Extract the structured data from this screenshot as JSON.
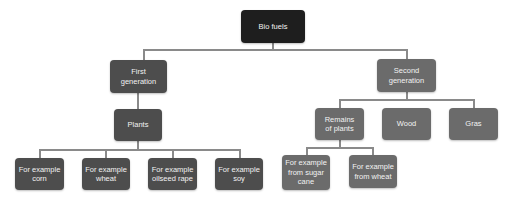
{
  "diagram": {
    "type": "tree",
    "root": {
      "label": "Bio fuels"
    },
    "first_generation": {
      "label": "First\ngeneration",
      "child": {
        "label": "Plants"
      },
      "examples": [
        {
          "label": "For example corn"
        },
        {
          "label": "For example wheat"
        },
        {
          "label": "For example oilseed rape"
        },
        {
          "label": "For example soy"
        }
      ]
    },
    "second_generation": {
      "label": "Second generation",
      "children": [
        {
          "label": "Remains of plants"
        },
        {
          "label": "Wood"
        },
        {
          "label": "Gras"
        }
      ],
      "remains_examples": [
        {
          "label": "For example from sugar cane"
        },
        {
          "label": "For example from wheat"
        }
      ]
    },
    "colors": {
      "root": "#1e1e1e",
      "first_generation_branch": "#4d4d4d",
      "second_generation_branch": "#6b6b6b",
      "connector": "#8a8a8a",
      "text": "#f2f2f2"
    }
  }
}
